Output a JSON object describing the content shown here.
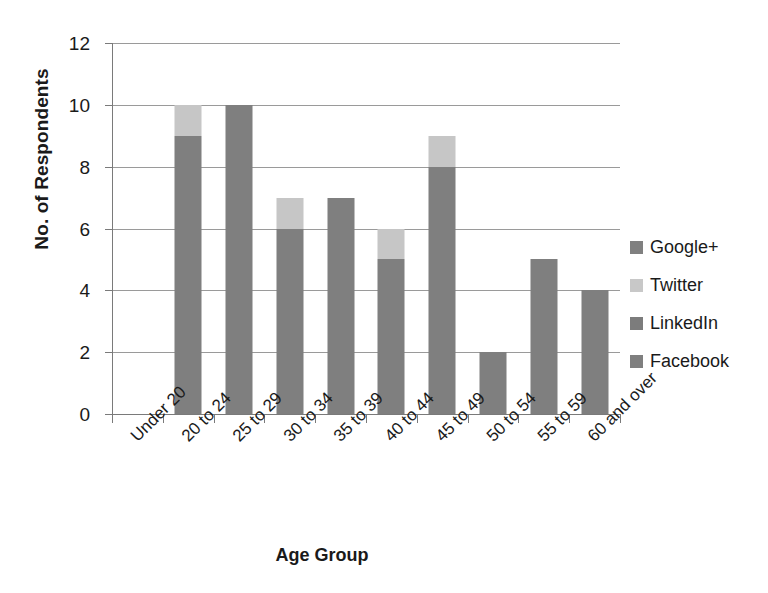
{
  "chart_data": {
    "type": "bar",
    "subtype": "stacked-column",
    "title": "",
    "xlabel": "Age Group",
    "ylabel": "No. of Respondents",
    "categories": [
      "Under 20",
      "20 to 24",
      "25 to 29",
      "30 to 34",
      "35 to 39",
      "40 to 44",
      "45 to 49",
      "50 to 54",
      "55 to 59",
      "60 and over"
    ],
    "series": [
      {
        "name": "Facebook",
        "color": "#7f7f7f",
        "values": [
          0,
          9,
          10,
          6,
          7,
          5,
          8,
          2,
          5,
          4
        ]
      },
      {
        "name": "LinkedIn",
        "color": "#7f7f7f",
        "values": [
          0,
          0,
          0,
          0,
          0,
          0,
          0,
          0,
          0,
          0
        ]
      },
      {
        "name": "Twitter",
        "color": "#c6c6c6",
        "values": [
          0,
          1,
          0,
          1,
          0,
          1,
          1,
          0,
          0,
          0
        ]
      },
      {
        "name": "Google+",
        "color": "#7f7f7f",
        "values": [
          0,
          0,
          0,
          0,
          0,
          0,
          0,
          0,
          0,
          0
        ]
      }
    ],
    "totals": [
      0,
      10,
      10,
      7,
      7,
      6,
      9,
      2,
      5,
      4
    ],
    "ylim": [
      0,
      12
    ],
    "ytick_step": 2,
    "yticks": [
      "0",
      "2",
      "4",
      "6",
      "8",
      "10",
      "12"
    ],
    "grid": "horizontal",
    "legend_position": "right",
    "legend_order": [
      "Google+",
      "Twitter",
      "LinkedIn",
      "Facebook"
    ]
  },
  "legend": {
    "items": [
      {
        "label": "Google+",
        "color": "#808080"
      },
      {
        "label": "Twitter",
        "color": "#c8c8c8"
      },
      {
        "label": "LinkedIn",
        "color": "#7c7c7c"
      },
      {
        "label": "Facebook",
        "color": "#7f7f7f"
      }
    ]
  },
  "axes": {
    "x_title": "Age Group",
    "y_title": "No. of Respondents"
  }
}
